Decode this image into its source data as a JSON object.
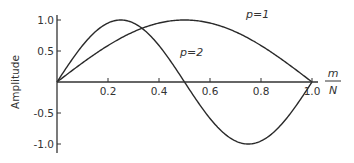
{
  "chart_data": {
    "type": "line",
    "title": "",
    "xlabel": "m/N",
    "xlabel_numerator": "m",
    "xlabel_denominator": "N",
    "ylabel": "Amplitude",
    "xlim": [
      0,
      1.0
    ],
    "ylim": [
      -1.0,
      1.0
    ],
    "grid": false,
    "legend": "inline labels",
    "x_ticks": [
      0.2,
      0.4,
      0.6,
      0.8,
      1.0
    ],
    "x_tick_labels": [
      "0.2",
      "0.4",
      "0.6",
      "0.8",
      "1.0"
    ],
    "y_ticks": [
      1.0,
      0.5,
      -0.5,
      -1.0
    ],
    "y_tick_labels": [
      "1.0",
      "0.5",
      "-0.5",
      "-1.0"
    ],
    "series": [
      {
        "name": "p=1",
        "function": "sin(pi * p * m/N)",
        "x": [
          0,
          0.1,
          0.2,
          0.3,
          0.4,
          0.5,
          0.6,
          0.7,
          0.8,
          0.9,
          1.0
        ],
        "values": [
          0,
          0.31,
          0.59,
          0.81,
          0.95,
          1.0,
          0.95,
          0.81,
          0.59,
          0.31,
          0
        ]
      },
      {
        "name": "p=2",
        "function": "sin(2 * pi * m/N)",
        "x": [
          0,
          0.1,
          0.2,
          0.25,
          0.3,
          0.4,
          0.5,
          0.6,
          0.7,
          0.75,
          0.8,
          0.9,
          1.0
        ],
        "values": [
          0,
          0.59,
          0.95,
          1.0,
          0.95,
          0.59,
          0,
          -0.59,
          -0.95,
          -1.0,
          -0.95,
          -0.59,
          0
        ]
      }
    ],
    "annotations": [
      {
        "text": "p=1",
        "x": 0.72,
        "y": 1.05
      },
      {
        "text": "p=2",
        "x": 0.38,
        "y": 0.42
      }
    ]
  }
}
